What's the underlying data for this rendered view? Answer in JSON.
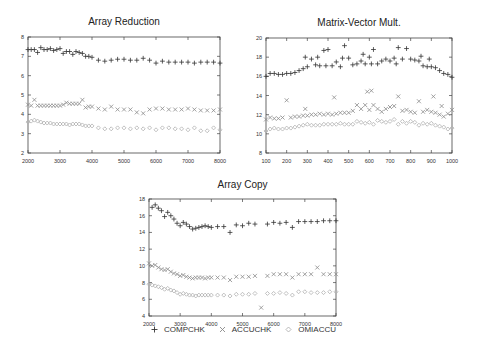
{
  "legend": {
    "items": [
      {
        "label": "COMPCHK",
        "marker": "plus",
        "color": "#333333"
      },
      {
        "label": "ACCUCHK",
        "marker": "cross",
        "color": "#8a8a8a"
      },
      {
        "label": "OMIACCU",
        "marker": "diamond",
        "color": "#b0b0b0"
      }
    ]
  },
  "chart_data": [
    {
      "id": "array-reduction",
      "type": "scatter",
      "title": "Array Reduction",
      "xlabel": "",
      "ylabel": "",
      "xlim": [
        2000,
        8000
      ],
      "ylim": [
        2,
        8
      ],
      "xticks": [
        "2000",
        "3000",
        "4000",
        "5000",
        "6000",
        "7000",
        "8000"
      ],
      "yticks": [
        "2",
        "3",
        "4",
        "5",
        "6",
        "7",
        "8"
      ],
      "grid": false,
      "legend_position": "shared-bottom",
      "series": [
        {
          "name": "COMPCHK",
          "x": [
            2000,
            2100,
            2200,
            2300,
            2400,
            2500,
            2600,
            2700,
            2800,
            2900,
            3000,
            3100,
            3200,
            3300,
            3400,
            3500,
            3600,
            3700,
            3800,
            3900,
            4000,
            4200,
            4400,
            4600,
            4800,
            5000,
            5200,
            5400,
            5600,
            5800,
            6000,
            6200,
            6400,
            6600,
            6800,
            7000,
            7200,
            7400,
            7600,
            7800,
            8000
          ],
          "y": [
            7.35,
            7.35,
            7.35,
            7.2,
            7.45,
            7.35,
            7.35,
            7.4,
            7.3,
            7.35,
            7.4,
            7.15,
            7.25,
            7.25,
            7.1,
            7.25,
            7.2,
            7.15,
            7.0,
            7.0,
            6.95,
            6.8,
            6.75,
            6.8,
            6.85,
            6.85,
            6.8,
            6.8,
            6.9,
            6.8,
            6.65,
            6.75,
            6.7,
            6.7,
            6.7,
            6.7,
            6.65,
            6.7,
            6.7,
            6.7,
            6.65
          ]
        },
        {
          "name": "ACCUCHK",
          "x": [
            2000,
            2100,
            2200,
            2300,
            2400,
            2500,
            2600,
            2700,
            2800,
            2900,
            3000,
            3100,
            3200,
            3300,
            3400,
            3500,
            3600,
            3700,
            3800,
            3900,
            4000,
            4200,
            4400,
            4600,
            4800,
            5000,
            5200,
            5400,
            5600,
            5800,
            6000,
            6200,
            6400,
            6600,
            6800,
            7000,
            7200,
            7400,
            7600,
            7800,
            8000
          ],
          "y": [
            4.5,
            4.45,
            4.75,
            4.45,
            4.45,
            4.45,
            4.45,
            4.45,
            4.45,
            4.45,
            4.45,
            4.5,
            4.6,
            4.55,
            4.55,
            4.55,
            4.55,
            4.75,
            4.35,
            4.4,
            4.4,
            4.3,
            4.25,
            4.4,
            4.25,
            4.25,
            4.25,
            4.1,
            4.05,
            4.25,
            4.3,
            4.3,
            4.25,
            4.25,
            4.25,
            4.3,
            4.25,
            4.2,
            4.2,
            4.2,
            4.25
          ]
        },
        {
          "name": "OMIACCU",
          "x": [
            2000,
            2100,
            2200,
            2300,
            2400,
            2500,
            2600,
            2700,
            2800,
            2900,
            3000,
            3100,
            3200,
            3300,
            3400,
            3500,
            3600,
            3700,
            3800,
            3900,
            4000,
            4200,
            4400,
            4600,
            4800,
            5000,
            5200,
            5400,
            5600,
            5800,
            6000,
            6200,
            6400,
            6600,
            6800,
            7000,
            7200,
            7400,
            7600,
            7800,
            8000
          ],
          "y": [
            3.6,
            3.65,
            3.7,
            3.65,
            3.6,
            3.55,
            3.55,
            3.55,
            3.5,
            3.5,
            3.5,
            3.5,
            3.5,
            3.45,
            3.5,
            3.5,
            3.5,
            3.45,
            3.4,
            3.4,
            3.4,
            3.3,
            3.25,
            3.25,
            3.3,
            3.3,
            3.25,
            3.3,
            3.25,
            3.3,
            3.2,
            3.3,
            3.3,
            3.25,
            3.25,
            3.2,
            3.3,
            3.15,
            3.15,
            3.3,
            3.2
          ]
        }
      ]
    },
    {
      "id": "matrix-vector-mult",
      "type": "scatter",
      "title": "Matrix-Vector Mult.",
      "xlabel": "",
      "ylabel": "",
      "xlim": [
        100,
        1000
      ],
      "ylim": [
        8,
        20
      ],
      "xticks": [
        "100",
        "200",
        "300",
        "400",
        "500",
        "600",
        "700",
        "800",
        "900",
        "1000"
      ],
      "yticks": [
        "8",
        "10",
        "12",
        "14",
        "16",
        "18",
        "20"
      ],
      "grid": false,
      "legend_position": "shared-bottom",
      "series": [
        {
          "name": "COMPCHK",
          "x": [
            100,
            120,
            140,
            160,
            180,
            200,
            220,
            240,
            260,
            280,
            290,
            300,
            320,
            340,
            350,
            360,
            380,
            390,
            400,
            420,
            440,
            460,
            470,
            480,
            500,
            520,
            540,
            560,
            570,
            580,
            600,
            610,
            620,
            640,
            660,
            680,
            700,
            720,
            730,
            740,
            760,
            780,
            800,
            820,
            840,
            850,
            860,
            880,
            890,
            900,
            920,
            940,
            960,
            980,
            1000
          ],
          "y": [
            16.0,
            16.3,
            16.3,
            16.2,
            16.2,
            16.3,
            16.3,
            16.4,
            16.6,
            16.8,
            18.0,
            17.0,
            17.8,
            17.2,
            18.0,
            17.1,
            18.7,
            17.1,
            18.8,
            17.1,
            17.5,
            17.0,
            17.9,
            19.2,
            17.9,
            17.2,
            17.3,
            17.6,
            18.3,
            17.3,
            18.0,
            17.3,
            18.8,
            17.3,
            17.6,
            17.8,
            17.6,
            17.9,
            17.3,
            19.0,
            17.8,
            18.9,
            17.8,
            17.7,
            17.6,
            18.1,
            17.1,
            17.0,
            17.8,
            17.0,
            16.9,
            16.6,
            16.3,
            16.2,
            15.9
          ]
        },
        {
          "name": "ACCUCHK",
          "x": [
            100,
            120,
            140,
            160,
            180,
            200,
            220,
            240,
            260,
            280,
            290,
            300,
            320,
            340,
            360,
            380,
            400,
            420,
            430,
            440,
            460,
            480,
            500,
            520,
            540,
            560,
            580,
            590,
            600,
            610,
            620,
            640,
            660,
            680,
            700,
            720,
            740,
            760,
            780,
            800,
            820,
            840,
            860,
            880,
            900,
            910,
            920,
            940,
            950,
            960,
            980,
            1000
          ],
          "y": [
            11.5,
            11.7,
            11.6,
            11.6,
            11.7,
            13.5,
            11.7,
            11.8,
            11.8,
            11.9,
            12.6,
            11.9,
            12.0,
            12.0,
            12.1,
            12.0,
            12.1,
            12.0,
            13.8,
            12.1,
            12.2,
            12.2,
            12.2,
            12.4,
            13.0,
            12.6,
            13.0,
            14.4,
            12.5,
            14.5,
            13.0,
            12.6,
            12.3,
            12.6,
            12.8,
            12.9,
            13.9,
            12.4,
            12.5,
            12.3,
            12.2,
            13.4,
            12.3,
            12.5,
            12.3,
            13.9,
            12.2,
            12.0,
            12.9,
            11.8,
            12.1,
            12.5
          ]
        },
        {
          "name": "OMIACCU",
          "x": [
            100,
            120,
            140,
            160,
            180,
            200,
            220,
            240,
            260,
            280,
            300,
            320,
            340,
            360,
            380,
            400,
            420,
            440,
            460,
            480,
            500,
            520,
            540,
            560,
            580,
            600,
            620,
            640,
            660,
            680,
            700,
            720,
            740,
            760,
            780,
            800,
            820,
            840,
            860,
            880,
            900,
            920,
            940,
            960,
            980,
            1000
          ],
          "y": [
            10.3,
            10.5,
            10.6,
            10.5,
            10.5,
            10.6,
            10.6,
            10.7,
            10.8,
            10.9,
            11.0,
            10.9,
            10.9,
            10.9,
            11.0,
            11.0,
            11.0,
            11.0,
            11.1,
            11.0,
            11.0,
            11.0,
            11.3,
            11.2,
            11.1,
            11.2,
            11.0,
            11.4,
            11.3,
            11.2,
            11.3,
            11.5,
            11.0,
            11.3,
            11.1,
            11.3,
            11.2,
            10.9,
            11.1,
            11.0,
            11.1,
            10.9,
            10.8,
            10.7,
            10.5,
            10.6
          ]
        }
      ]
    },
    {
      "id": "array-copy",
      "type": "scatter",
      "title": "Array Copy",
      "xlabel": "",
      "ylabel": "",
      "xlim": [
        2000,
        8000
      ],
      "ylim": [
        4,
        18
      ],
      "xticks": [
        "2000",
        "3000",
        "4000",
        "5000",
        "6000",
        "7000",
        "8000"
      ],
      "yticks": [
        "4",
        "6",
        "8",
        "10",
        "12",
        "14",
        "16",
        "18"
      ],
      "grid": false,
      "legend_position": "bottom",
      "series": [
        {
          "name": "COMPCHK",
          "x": [
            2100,
            2200,
            2300,
            2400,
            2500,
            2600,
            2700,
            2800,
            2900,
            3000,
            3100,
            3200,
            3300,
            3400,
            3500,
            3600,
            3700,
            3800,
            3900,
            4000,
            4200,
            4400,
            4600,
            4800,
            5000,
            5200,
            5400,
            5800,
            6000,
            6200,
            6400,
            6600,
            6800,
            7000,
            7200,
            7400,
            7600,
            7800,
            8000
          ],
          "y": [
            17.0,
            17.3,
            16.9,
            16.6,
            15.9,
            16.4,
            16.0,
            15.6,
            15.1,
            14.8,
            15.2,
            15.0,
            14.7,
            14.4,
            14.5,
            14.6,
            14.7,
            14.8,
            14.7,
            14.6,
            14.7,
            14.7,
            14.0,
            14.9,
            14.8,
            15.1,
            15.0,
            15.0,
            15.2,
            15.1,
            15.2,
            14.6,
            15.3,
            15.3,
            15.3,
            15.3,
            15.4,
            15.4,
            15.4
          ]
        },
        {
          "name": "ACCUCHK",
          "x": [
            2000,
            2100,
            2200,
            2300,
            2400,
            2500,
            2600,
            2700,
            2800,
            2900,
            3000,
            3100,
            3200,
            3300,
            3400,
            3500,
            3600,
            3700,
            3800,
            3900,
            4000,
            4200,
            4400,
            4600,
            4800,
            5000,
            5200,
            5400,
            5600,
            5800,
            6000,
            6200,
            6400,
            6600,
            6800,
            7000,
            7200,
            7400,
            7600,
            7800,
            8000
          ],
          "y": [
            10.3,
            10.0,
            10.1,
            9.8,
            9.6,
            9.5,
            9.6,
            9.3,
            9.1,
            9.0,
            8.8,
            8.9,
            8.7,
            8.6,
            8.5,
            8.6,
            8.6,
            8.6,
            8.5,
            8.6,
            8.6,
            8.6,
            8.6,
            8.3,
            8.7,
            8.7,
            8.7,
            8.8,
            5.0,
            8.8,
            9.0,
            9.0,
            9.0,
            8.6,
            9.0,
            9.0,
            9.0,
            9.8,
            9.0,
            9.0,
            9.0
          ]
        },
        {
          "name": "OMIACCU",
          "x": [
            2000,
            2100,
            2200,
            2300,
            2400,
            2500,
            2600,
            2700,
            2800,
            2900,
            3000,
            3100,
            3200,
            3300,
            3400,
            3500,
            3600,
            3700,
            3800,
            3900,
            4000,
            4200,
            4400,
            4600,
            4800,
            5000,
            5200,
            5400,
            5800,
            6000,
            6200,
            6400,
            6600,
            6800,
            7000,
            7200,
            7400,
            7600,
            7800,
            8000
          ],
          "y": [
            7.8,
            7.7,
            7.6,
            7.5,
            7.4,
            7.2,
            7.3,
            7.1,
            7.0,
            6.8,
            6.6,
            6.7,
            6.6,
            6.5,
            6.5,
            6.4,
            6.5,
            6.5,
            6.5,
            6.5,
            6.5,
            6.5,
            6.5,
            6.4,
            6.6,
            6.6,
            6.6,
            6.7,
            6.7,
            6.7,
            6.8,
            6.7,
            6.5,
            6.9,
            6.9,
            6.8,
            6.8,
            6.8,
            6.9,
            6.9
          ]
        }
      ]
    }
  ]
}
